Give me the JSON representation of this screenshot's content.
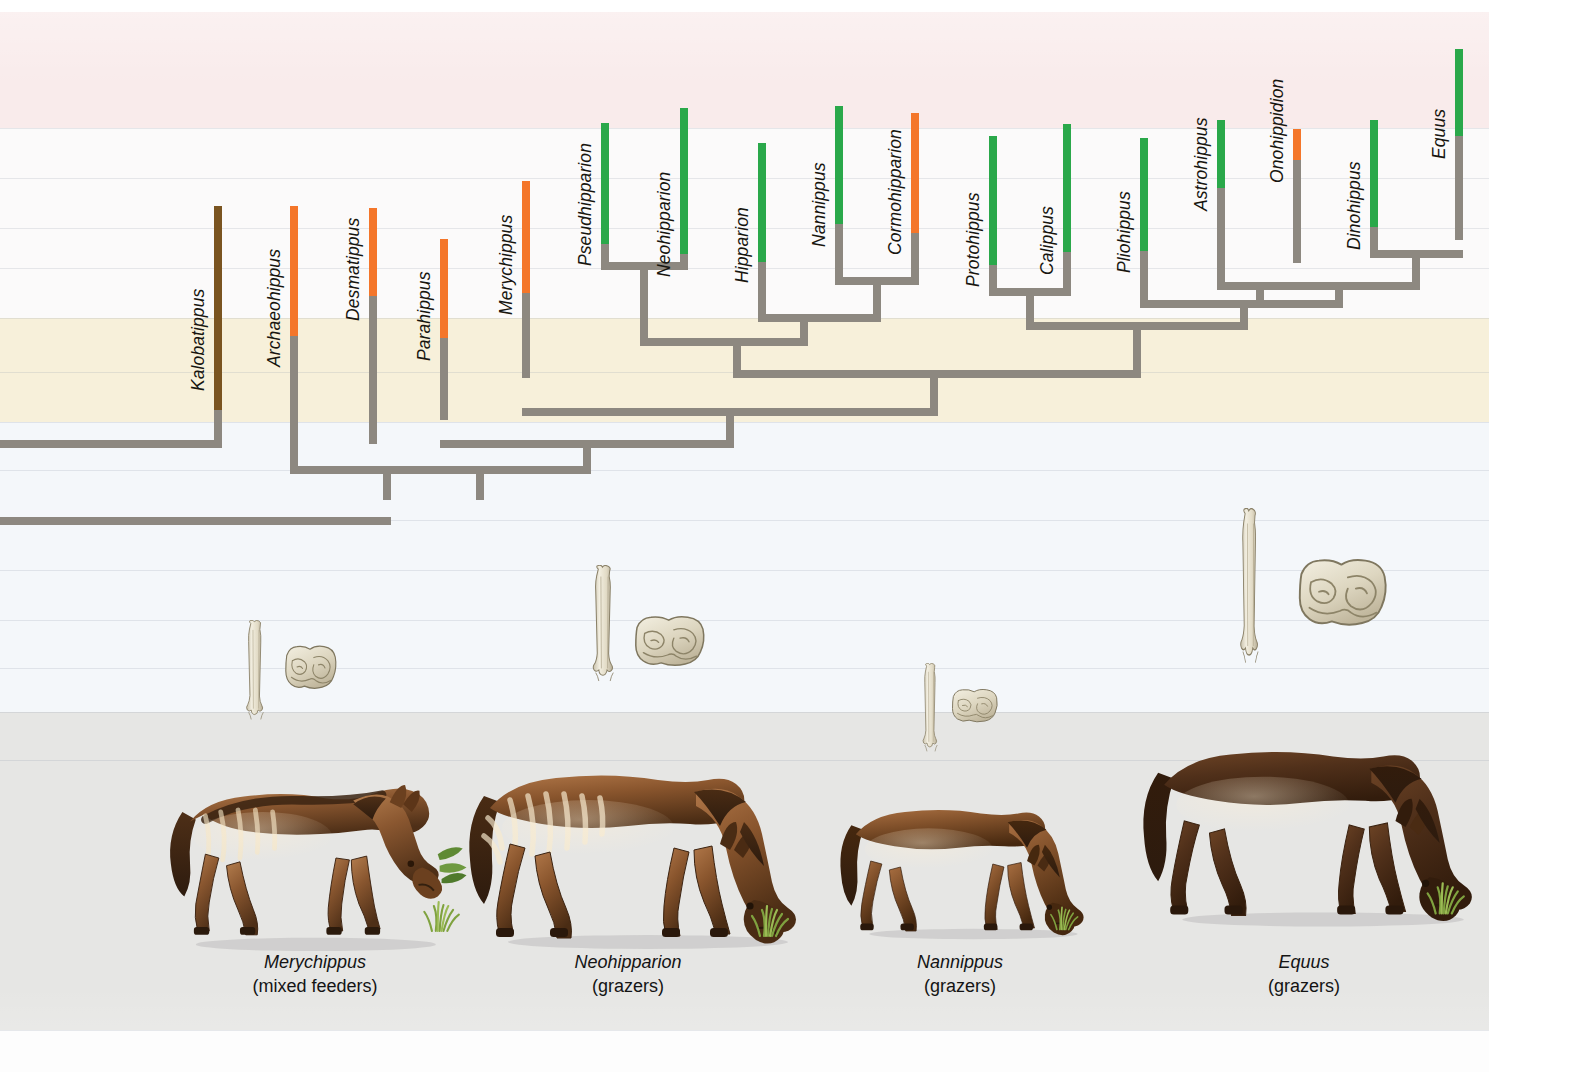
{
  "figure": {
    "type": "cladogram",
    "canvas": {
      "width": 1583,
      "height": 1072,
      "content_width": 1489
    }
  },
  "legend_colors": {
    "browser_brown": "#7a5420",
    "mixed_feeder_orange": "#f4762a",
    "grazer_green": "#2aa84a",
    "lineage_gray": "#8d8880",
    "ink": "#17150f"
  },
  "background_bands": [
    {
      "name": "top-white",
      "top": 0,
      "height": 12,
      "color": "#ffffff"
    },
    {
      "name": "pink-band",
      "top": 12,
      "height": 116,
      "color": "#f9ebeb"
    },
    {
      "name": "white-band-1",
      "top": 128,
      "height": 190,
      "color": "#fbfafa"
    },
    {
      "name": "cream-band",
      "top": 318,
      "height": 104,
      "color": "#f7f0da"
    },
    {
      "name": "pale-blue-band",
      "top": 422,
      "height": 290,
      "color": "#f4f7fa"
    },
    {
      "name": "gray-band",
      "top": 712,
      "height": 318,
      "color": "#e6e6e4"
    },
    {
      "name": "bottom-white",
      "top": 1030,
      "height": 42,
      "color": "#fdfdfd"
    }
  ],
  "hairlines_y": [
    128,
    178,
    228,
    268,
    318,
    372,
    422,
    470,
    520,
    570,
    620,
    668,
    712,
    760,
    1030
  ],
  "taxa": [
    {
      "id": "kalobatippus",
      "label": "Kalobatippus",
      "x": 214,
      "diet_color": "#7a5420",
      "bar_top": 206,
      "diet_bottom": 410,
      "stem_bottom": 440,
      "label_bottom": 370
    },
    {
      "id": "archaeohippus",
      "label": "Archaeohippus",
      "x": 290,
      "diet_color": "#f4762a",
      "bar_top": 206,
      "diet_bottom": 336,
      "stem_bottom": 466,
      "label_bottom": 346
    },
    {
      "id": "desmatippus",
      "label": "Desmatippus",
      "x": 369,
      "diet_color": "#f4762a",
      "bar_top": 208,
      "diet_bottom": 296,
      "stem_bottom": 444,
      "label_bottom": 300
    },
    {
      "id": "parahippus",
      "label": "Parahippus",
      "x": 440,
      "diet_color": "#f4762a",
      "bar_top": 239,
      "diet_bottom": 338,
      "stem_bottom": 420,
      "label_bottom": 340
    },
    {
      "id": "merychippus",
      "label": "Merychippus",
      "x": 522,
      "diet_color": "#f4762a",
      "bar_top": 181,
      "diet_bottom": 293,
      "stem_bottom": 378,
      "label_bottom": 294
    },
    {
      "id": "pseudhipparion",
      "label": "Pseudhipparion",
      "x": 601,
      "diet_color": "#2aa84a",
      "bar_top": 123,
      "diet_bottom": 244,
      "stem_bottom": 262,
      "label_bottom": 245
    },
    {
      "id": "neohipparion",
      "label": "Neohipparion",
      "x": 680,
      "diet_color": "#2aa84a",
      "bar_top": 108,
      "diet_bottom": 254,
      "stem_bottom": 262,
      "label_bottom": 256
    },
    {
      "id": "hipparion",
      "label": "Hipparion",
      "x": 758,
      "diet_color": "#2aa84a",
      "bar_top": 143,
      "diet_bottom": 262,
      "stem_bottom": 314,
      "label_bottom": 262
    },
    {
      "id": "nannippus",
      "label": "Nannippus",
      "x": 835,
      "diet_color": "#2aa84a",
      "bar_top": 106,
      "diet_bottom": 224,
      "stem_bottom": 277,
      "label_bottom": 226
    },
    {
      "id": "cormohipparion",
      "label": "Cormohipparion",
      "x": 911,
      "diet_color": "#f4762a",
      "bar_top": 113,
      "diet_bottom": 233,
      "stem_bottom": 277,
      "label_bottom": 234
    },
    {
      "id": "protohippus",
      "label": "Protohippus",
      "x": 989,
      "diet_color": "#2aa84a",
      "bar_top": 136,
      "diet_bottom": 265,
      "stem_bottom": 288,
      "label_bottom": 266
    },
    {
      "id": "calippus",
      "label": "Calippus",
      "x": 1063,
      "diet_color": "#2aa84a",
      "bar_top": 124,
      "diet_bottom": 252,
      "stem_bottom": 288,
      "label_bottom": 254
    },
    {
      "id": "pliohippus",
      "label": "Pliohippus",
      "x": 1140,
      "diet_color": "#2aa84a",
      "bar_top": 138,
      "diet_bottom": 251,
      "stem_bottom": 300,
      "label_bottom": 252
    },
    {
      "id": "astrohippus",
      "label": "Astrohippus",
      "x": 1217,
      "diet_color": "#2aa84a",
      "bar_top": 120,
      "diet_bottom": 188,
      "stem_bottom": 282,
      "label_bottom": 190
    },
    {
      "id": "onohippidion",
      "label": "Onohippidion",
      "x": 1293,
      "diet_color": "#f4762a",
      "bar_top": 129,
      "diet_bottom": 160,
      "stem_bottom": 263,
      "label_bottom": 162
    },
    {
      "id": "dinohippus",
      "label": "Dinohippus",
      "x": 1370,
      "diet_color": "#2aa84a",
      "bar_top": 120,
      "diet_bottom": 227,
      "stem_bottom": 250,
      "label_bottom": 229
    },
    {
      "id": "equus",
      "label": "Equus",
      "x": 1455,
      "diet_color": "#2aa84a",
      "bar_top": 49,
      "diet_bottom": 136,
      "stem_bottom": 240,
      "label_bottom": 138
    }
  ],
  "tree_nodes": [
    {
      "id": "n-pseud-neo",
      "y": 262,
      "x1": 601,
      "x2": 680,
      "down_x": 640,
      "down_to": 338
    },
    {
      "id": "n-nan-cormo",
      "y": 277,
      "x1": 835,
      "x2": 911,
      "down_x": 873,
      "down_to": 312
    },
    {
      "id": "n-hip-nancormo",
      "y": 314,
      "x1": 758,
      "x2": 873,
      "down_x": 800,
      "down_to": 338
    },
    {
      "id": "n-hipparionini",
      "y": 338,
      "x1": 640,
      "x2": 800,
      "down_x": 733,
      "down_to": 370
    },
    {
      "id": "n-proto-cali",
      "y": 288,
      "x1": 989,
      "x2": 1063,
      "down_x": 1026,
      "down_to": 322
    },
    {
      "id": "n-astro-ono",
      "y": 282,
      "x1": 1217,
      "x2": 1293,
      "down_x": 1256,
      "down_to": 300
    },
    {
      "id": "n-dino-equus",
      "y": 250,
      "x1": 1370,
      "x2": 1455,
      "down_x": 1412,
      "down_to": 282
    },
    {
      "id": "n-astroono-dino",
      "y": 282,
      "x1": 1256,
      "x2": 1412,
      "down_x": 1335,
      "down_to": 300
    },
    {
      "id": "n-plio-rest",
      "y": 300,
      "x1": 1140,
      "x2": 1335,
      "down_x": 1240,
      "down_to": 322
    },
    {
      "id": "n-equini",
      "y": 322,
      "x1": 1026,
      "x2": 1240,
      "down_x": 1133,
      "down_to": 370
    },
    {
      "id": "n-crown",
      "y": 370,
      "x1": 733,
      "x2": 1133,
      "down_x": 930,
      "down_to": 408
    },
    {
      "id": "n-mery-crown",
      "y": 408,
      "x1": 522,
      "x2": 930,
      "down_x": 726,
      "down_to": 440
    },
    {
      "id": "n-para-node",
      "y": 440,
      "x1": 440,
      "x2": 726,
      "down_x": 583,
      "down_to": 466
    },
    {
      "id": "n-desma-node",
      "y": 466,
      "x1": 369,
      "x2": 583,
      "down_x": 476,
      "down_to": 492
    },
    {
      "id": "n-arch-node",
      "y": 466,
      "x1": 290,
      "x2": 476,
      "down_x": 383,
      "down_to": 492
    },
    {
      "id": "n-kalo-node",
      "y": 440,
      "x1": 0,
      "x2": 214,
      "down_x": 0,
      "down_to": 440
    },
    {
      "id": "n-root",
      "y": 517,
      "x1": 0,
      "x2": 383,
      "down_x": 0,
      "down_to": 517
    }
  ],
  "fossils": [
    {
      "id": "fossil-merychippus",
      "bone_x": 243,
      "bone_y": 620,
      "bone_w": 26,
      "bone_h": 108,
      "tooth_x": 283,
      "tooth_y": 643,
      "tooth_w": 56,
      "tooth_h": 52,
      "label": "metapodial-and-molar"
    },
    {
      "id": "fossil-neohipparion",
      "bone_x": 589,
      "bone_y": 565,
      "bone_w": 31,
      "bone_h": 126,
      "tooth_x": 632,
      "tooth_y": 613,
      "tooth_w": 76,
      "tooth_h": 60,
      "label": "metapodial-and-molar"
    },
    {
      "id": "fossil-nannippus",
      "bone_x": 920,
      "bone_y": 663,
      "bone_w": 22,
      "bone_h": 96,
      "tooth_x": 950,
      "tooth_y": 687,
      "tooth_w": 50,
      "tooth_h": 40,
      "label": "metapodial-and-molar"
    },
    {
      "id": "fossil-equus",
      "bone_x": 1237,
      "bone_y": 508,
      "bone_w": 27,
      "bone_h": 168,
      "tooth_x": 1295,
      "tooth_y": 555,
      "tooth_w": 96,
      "tooth_h": 80,
      "label": "metapodial-and-molar"
    }
  ],
  "plates": [
    {
      "id": "plate-merychippus",
      "species": "Merychippus",
      "diet": "(mixed feeders)",
      "caption_x": 148,
      "caption_y": 951,
      "caption_w": 334,
      "art_x": 142,
      "art_y": 762,
      "art_w": 338,
      "art_h": 192
    },
    {
      "id": "plate-neohipparion",
      "species": "Neohipparion",
      "diet": "(grazers)",
      "caption_x": 452,
      "caption_y": 951,
      "caption_w": 352,
      "art_x": 458,
      "art_y": 752,
      "art_w": 360,
      "art_h": 200
    },
    {
      "id": "plate-nannippus",
      "species": "Nannippus",
      "diet": "(grazers)",
      "caption_x": 810,
      "caption_y": 951,
      "caption_w": 300,
      "art_x": 832,
      "art_y": 784,
      "art_w": 268,
      "art_h": 166
    },
    {
      "id": "plate-equus",
      "species": "Equus",
      "diet": "(grazers)",
      "caption_x": 1142,
      "caption_y": 951,
      "caption_w": 324,
      "art_x": 1132,
      "art_y": 708,
      "art_w": 362,
      "art_h": 242
    }
  ]
}
